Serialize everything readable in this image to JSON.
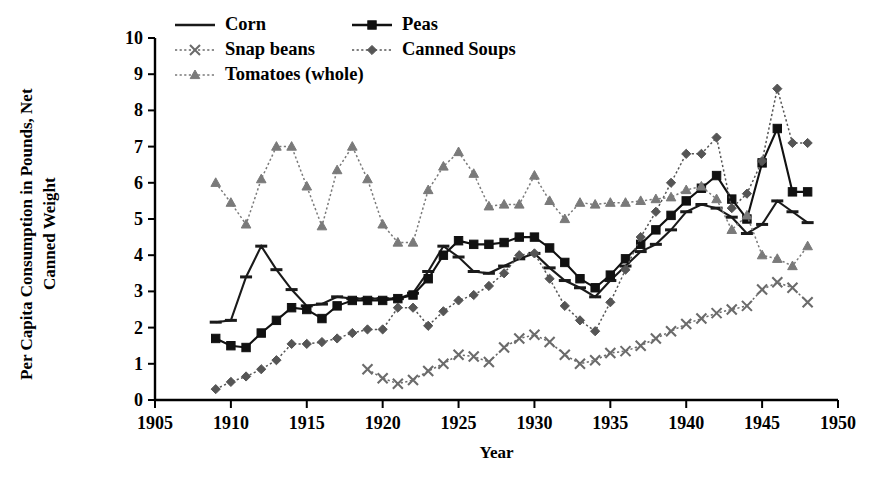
{
  "chart_data": {
    "type": "line",
    "title": "",
    "xlabel": "Year",
    "ylabel": "Per Capita Consumption in Pounds, Net Canned Weight",
    "xlim": [
      1905,
      1950
    ],
    "ylim": [
      0,
      10
    ],
    "xticks": [
      "1905",
      "1910",
      "1915",
      "1920",
      "1925",
      "1930",
      "1935",
      "1940",
      "1945",
      "1950"
    ],
    "yticks": [
      "0",
      "1",
      "2",
      "3",
      "4",
      "5",
      "6",
      "7",
      "8",
      "9",
      "10"
    ],
    "grid": false,
    "legend_position": "top-left-inside",
    "series": [
      {
        "name": "Corn",
        "marker": "dash",
        "color": "#1a1a1a",
        "linestyle": "solid",
        "x": [
          1909,
          1910,
          1911,
          1912,
          1913,
          1914,
          1915,
          1916,
          1917,
          1918,
          1919,
          1920,
          1921,
          1922,
          1923,
          1924,
          1925,
          1926,
          1927,
          1928,
          1929,
          1930,
          1931,
          1932,
          1933,
          1934,
          1935,
          1936,
          1937,
          1938,
          1939,
          1940,
          1941,
          1942,
          1943,
          1944,
          1945,
          1946,
          1947,
          1948
        ],
        "values": [
          2.15,
          2.2,
          3.4,
          4.25,
          3.6,
          3.05,
          2.6,
          2.65,
          2.85,
          2.8,
          2.8,
          2.8,
          2.8,
          2.95,
          3.55,
          4.25,
          3.95,
          3.55,
          3.5,
          3.7,
          3.9,
          4.05,
          3.65,
          3.3,
          3.1,
          2.85,
          3.3,
          3.7,
          4.1,
          4.3,
          4.7,
          5.2,
          5.4,
          5.3,
          5.05,
          4.6,
          4.85,
          5.5,
          5.2,
          4.9
        ]
      },
      {
        "name": "Peas",
        "marker": "square",
        "color": "#111111",
        "linestyle": "solid",
        "x": [
          1909,
          1910,
          1911,
          1912,
          1913,
          1914,
          1915,
          1916,
          1917,
          1918,
          1919,
          1920,
          1921,
          1922,
          1923,
          1924,
          1925,
          1926,
          1927,
          1928,
          1929,
          1930,
          1931,
          1932,
          1933,
          1934,
          1935,
          1936,
          1937,
          1938,
          1939,
          1940,
          1941,
          1942,
          1943,
          1944,
          1945,
          1946,
          1947,
          1948
        ],
        "values": [
          1.7,
          1.5,
          1.45,
          1.85,
          2.2,
          2.55,
          2.5,
          2.25,
          2.6,
          2.75,
          2.75,
          2.75,
          2.8,
          2.9,
          3.35,
          4.0,
          4.4,
          4.3,
          4.3,
          4.35,
          4.5,
          4.5,
          4.2,
          3.8,
          3.35,
          3.1,
          3.45,
          3.9,
          4.3,
          4.7,
          5.1,
          5.5,
          5.85,
          6.2,
          5.55,
          5.0,
          6.55,
          7.5,
          5.75,
          5.75
        ]
      },
      {
        "name": "Snap beans",
        "marker": "x",
        "color": "#6b6b6b",
        "linestyle": "dotted",
        "x": [
          1919,
          1920,
          1921,
          1922,
          1923,
          1924,
          1925,
          1926,
          1927,
          1928,
          1929,
          1930,
          1931,
          1932,
          1933,
          1934,
          1935,
          1936,
          1937,
          1938,
          1939,
          1940,
          1941,
          1942,
          1943,
          1944,
          1945,
          1946,
          1947,
          1948
        ],
        "values": [
          0.85,
          0.6,
          0.45,
          0.55,
          0.8,
          1.0,
          1.25,
          1.2,
          1.05,
          1.45,
          1.7,
          1.8,
          1.6,
          1.25,
          1.0,
          1.1,
          1.3,
          1.35,
          1.5,
          1.7,
          1.9,
          2.1,
          2.25,
          2.4,
          2.5,
          2.6,
          3.05,
          3.25,
          3.1,
          2.7
        ]
      },
      {
        "name": "Canned Soups",
        "marker": "diamond",
        "color": "#555555",
        "linestyle": "dotted",
        "x": [
          1909,
          1910,
          1911,
          1912,
          1913,
          1914,
          1915,
          1916,
          1917,
          1918,
          1919,
          1920,
          1921,
          1922,
          1923,
          1924,
          1925,
          1926,
          1927,
          1928,
          1929,
          1930,
          1931,
          1932,
          1933,
          1934,
          1935,
          1936,
          1937,
          1938,
          1939,
          1940,
          1941,
          1942,
          1943,
          1944,
          1945,
          1946,
          1947,
          1948
        ],
        "values": [
          0.3,
          0.5,
          0.65,
          0.85,
          1.1,
          1.55,
          1.55,
          1.6,
          1.7,
          1.85,
          1.95,
          1.95,
          2.55,
          2.55,
          2.05,
          2.45,
          2.75,
          2.9,
          3.15,
          3.5,
          4.0,
          4.05,
          3.35,
          2.6,
          2.2,
          1.9,
          2.7,
          3.6,
          4.5,
          5.2,
          6.0,
          6.8,
          6.8,
          7.25,
          5.3,
          5.7,
          6.6,
          8.6,
          7.1,
          7.1
        ]
      },
      {
        "name": "Tomatoes (whole)",
        "marker": "triangle",
        "color": "#7a7a7a",
        "linestyle": "dotted",
        "x": [
          1909,
          1910,
          1911,
          1912,
          1913,
          1914,
          1915,
          1916,
          1917,
          1918,
          1919,
          1920,
          1921,
          1922,
          1923,
          1924,
          1925,
          1926,
          1927,
          1928,
          1929,
          1930,
          1931,
          1932,
          1933,
          1934,
          1935,
          1936,
          1937,
          1938,
          1939,
          1940,
          1941,
          1942,
          1943,
          1944,
          1945,
          1946,
          1947,
          1948
        ],
        "values": [
          6.0,
          5.45,
          4.85,
          6.1,
          7.0,
          7.0,
          5.9,
          4.8,
          6.35,
          7.0,
          6.1,
          4.85,
          4.35,
          4.35,
          5.8,
          6.45,
          6.85,
          6.25,
          5.35,
          5.4,
          5.4,
          6.2,
          5.5,
          5.0,
          5.45,
          5.4,
          5.45,
          5.45,
          5.5,
          5.55,
          5.6,
          5.8,
          5.9,
          5.55,
          4.7,
          5.1,
          4.0,
          3.9,
          3.7,
          4.25
        ]
      }
    ]
  },
  "legend": {
    "items": [
      {
        "label": "Corn"
      },
      {
        "label": "Peas"
      },
      {
        "label": "Snap beans"
      },
      {
        "label": "Canned Soups"
      },
      {
        "label": "Tomatoes (whole)"
      }
    ]
  }
}
